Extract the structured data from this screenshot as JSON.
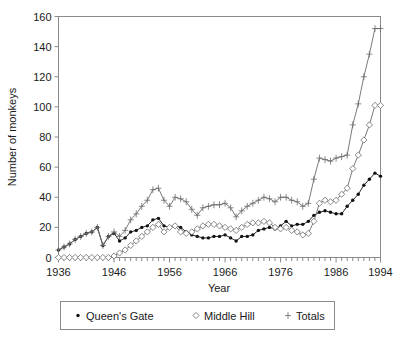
{
  "chart_data": {
    "type": "line",
    "title": "",
    "xlabel": "Year",
    "ylabel": "Number of monkeys",
    "xlim": [
      1936,
      1994
    ],
    "ylim": [
      0,
      160
    ],
    "ytick_labels": [
      "0",
      "20",
      "40",
      "60",
      "80",
      "100",
      "120",
      "140",
      "160"
    ],
    "yticks": [
      0,
      20,
      40,
      60,
      80,
      100,
      120,
      140,
      160
    ],
    "xtick_labels": [
      "1936",
      "1946",
      "1956",
      "1966",
      "1976",
      "1986",
      "1994"
    ],
    "xticks": [
      1936,
      1946,
      1956,
      1966,
      1976,
      1986,
      1994
    ],
    "grid": false,
    "legend_position": "below",
    "x": [
      1936,
      1937,
      1938,
      1939,
      1940,
      1941,
      1942,
      1943,
      1944,
      1945,
      1946,
      1947,
      1948,
      1949,
      1950,
      1951,
      1952,
      1953,
      1954,
      1955,
      1956,
      1957,
      1958,
      1959,
      1960,
      1961,
      1962,
      1963,
      1964,
      1965,
      1966,
      1967,
      1968,
      1969,
      1970,
      1971,
      1972,
      1973,
      1974,
      1975,
      1976,
      1977,
      1978,
      1979,
      1980,
      1981,
      1982,
      1983,
      1984,
      1985,
      1986,
      1987,
      1988,
      1989,
      1990,
      1991,
      1992,
      1993,
      1994
    ],
    "series": [
      {
        "name": "Queen's Gate",
        "marker": "filled-circle",
        "color": "#111111",
        "values": [
          5,
          7,
          9,
          12,
          14,
          16,
          17,
          20,
          8,
          14,
          16,
          11,
          13,
          17,
          18,
          20,
          21,
          25,
          26,
          21,
          20,
          21,
          20,
          17,
          15,
          14,
          13,
          13,
          14,
          14,
          15,
          13,
          11,
          14,
          14,
          15,
          18,
          19,
          20,
          19,
          21,
          24,
          21,
          22,
          22,
          24,
          28,
          30,
          31,
          30,
          29,
          29,
          34,
          38,
          42,
          48,
          52,
          56,
          54
        ]
      },
      {
        "name": "Middle Hill",
        "marker": "open-diamond",
        "color": "#6b6b6b",
        "values": [
          0,
          0,
          0,
          0,
          0,
          0,
          0,
          0,
          0,
          0,
          1,
          3,
          5,
          8,
          11,
          14,
          17,
          20,
          22,
          17,
          20,
          21,
          17,
          16,
          17,
          19,
          21,
          22,
          22,
          21,
          20,
          19,
          18,
          20,
          22,
          23,
          23,
          24,
          23,
          20,
          19,
          20,
          18,
          17,
          15,
          16,
          24,
          36,
          38,
          37,
          38,
          42,
          46,
          59,
          68,
          78,
          88,
          101,
          101
        ]
      },
      {
        "name": "Totals",
        "marker": "plus",
        "color": "#6b6b6b",
        "values": [
          5,
          7,
          9,
          12,
          14,
          16,
          17,
          20,
          8,
          14,
          17,
          14,
          18,
          25,
          29,
          34,
          38,
          45,
          46,
          38,
          34,
          40,
          39,
          37,
          32,
          28,
          33,
          34,
          35,
          35,
          36,
          33,
          27,
          31,
          34,
          36,
          38,
          40,
          39,
          37,
          40,
          40,
          38,
          37,
          34,
          36,
          52,
          66,
          65,
          64,
          66,
          67,
          68,
          88,
          102,
          120,
          135,
          152,
          152
        ]
      }
    ]
  },
  "legend": {
    "items": [
      {
        "label": "Queen's Gate",
        "marker": "filled-circle"
      },
      {
        "label": "Middle Hill",
        "marker": "open-diamond"
      },
      {
        "label": "Totals",
        "marker": "plus"
      }
    ]
  },
  "colors": {
    "queens_gate": "#111111",
    "middle_hill": "#6b6b6b",
    "totals": "#6b6b6b",
    "axis": "#8a8a8a",
    "text": "#1a1a1a",
    "background": "#ffffff"
  }
}
